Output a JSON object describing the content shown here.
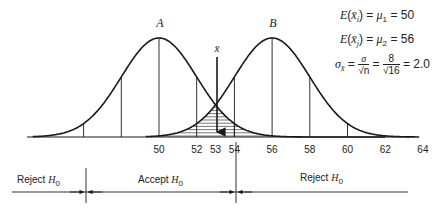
{
  "curves": {
    "a": {
      "label": "A",
      "mean": 50,
      "sd": 2.0
    },
    "b": {
      "label": "B",
      "mean": 56,
      "sd": 2.0
    }
  },
  "sample_mean_label": "x̄",
  "sample_mean_value": 53,
  "axis": {
    "ticks": [
      "50",
      "52",
      "53",
      "54",
      "56",
      "58",
      "60",
      "62",
      "64"
    ],
    "tick_values": [
      50,
      52,
      53,
      54,
      56,
      58,
      60,
      62,
      64
    ]
  },
  "formulas": {
    "line1": {
      "lhs": "E",
      "var": "x̄",
      "var_sub": "i",
      "mu_sub": "1",
      "value": "50"
    },
    "line2": {
      "lhs": "E",
      "var": "x̄",
      "var_sub": "j",
      "mu_sub": "2",
      "value": "56"
    },
    "line3": {
      "sigma": "σ",
      "sigma_sub": "x̄",
      "num1": "σ",
      "den1": "√n",
      "num2": "8",
      "den2": "√16",
      "result": "2.0"
    }
  },
  "regions": {
    "left": "Reject",
    "middle": "Accept",
    "right": "Reject",
    "hypothesis": "H",
    "hypothesis_sub": "0"
  },
  "colors": {
    "ink": "#1a1a1a"
  }
}
